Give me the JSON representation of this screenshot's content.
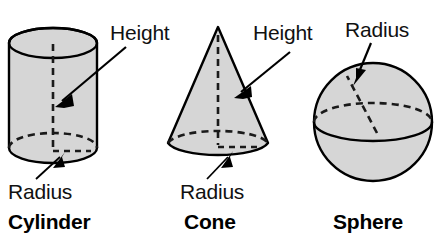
{
  "figure": {
    "background_color": "#ffffff",
    "outline_color": "#000000",
    "fill_color": "#d6d6d6",
    "dash_color": "#1a1a1a"
  },
  "solids": [
    {
      "name": "Cylinder",
      "name_label": "Cylinder",
      "labels": {
        "height": "Height",
        "radius": "Radius"
      }
    },
    {
      "name": "Cone",
      "name_label": "Cone",
      "labels": {
        "height": "Height",
        "radius": "Radius"
      }
    },
    {
      "name": "Sphere",
      "name_label": "Sphere",
      "labels": {
        "radius": "Radius"
      }
    }
  ]
}
